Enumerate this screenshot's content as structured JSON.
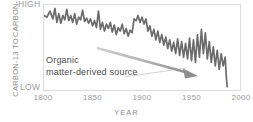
{
  "chart_data": {
    "type": "line",
    "title": "",
    "xlabel": "YEAR",
    "ylabel": "CARBON-13 TO CARBON-12 RATIO",
    "ylabel_line1": "CARBON-13 TO",
    "ylabel_line2": "CARBON-12 RATIO",
    "xlim": [
      1800,
      2000
    ],
    "ylim": [
      0,
      100
    ],
    "ytick_labels": [
      "HIGH",
      "LOW"
    ],
    "ytick_high": "HIGH",
    "ytick_low": "LOW",
    "xtick_labels": [
      "1800",
      "1850",
      "1900",
      "1950",
      "2000"
    ],
    "xticks": [
      1800,
      1850,
      1900,
      1950,
      2000
    ],
    "grid": false,
    "legend": "none",
    "line_color": "#6b6b6b",
    "frame_color": "#dcdcdc",
    "annotations": [
      {
        "text_line1": "Organic",
        "text_line2": "matter-derived source",
        "text": "Organic matter-derived source",
        "arrow_color": "#9a9a9a",
        "arrow_from": [
          1846,
          62
        ],
        "arrow_to": [
          1945,
          28
        ]
      }
    ],
    "x": [
      1800,
      1803,
      1806,
      1809,
      1811,
      1813,
      1815,
      1817,
      1819,
      1821,
      1823,
      1825,
      1827,
      1829,
      1831,
      1833,
      1835,
      1837,
      1839,
      1841,
      1843,
      1845,
      1847,
      1849,
      1851,
      1853,
      1855,
      1857,
      1859,
      1861,
      1863,
      1865,
      1867,
      1869,
      1871,
      1873,
      1875,
      1877,
      1879,
      1881,
      1883,
      1885,
      1887,
      1889,
      1891,
      1893,
      1895,
      1897,
      1899,
      1901,
      1903,
      1905,
      1907,
      1909,
      1911,
      1913,
      1915,
      1917,
      1919,
      1921,
      1923,
      1925,
      1927,
      1929,
      1931,
      1933,
      1935,
      1937,
      1939,
      1941,
      1943,
      1945,
      1947,
      1949,
      1951,
      1953,
      1955,
      1957,
      1959,
      1961,
      1963,
      1965,
      1967,
      1969,
      1971,
      1973,
      1975,
      1977,
      1979,
      1981,
      1983,
      1984,
      1985
    ],
    "values": [
      88,
      86,
      93,
      84,
      96,
      80,
      90,
      79,
      88,
      83,
      95,
      82,
      88,
      80,
      90,
      78,
      86,
      83,
      94,
      81,
      85,
      79,
      84,
      76,
      82,
      74,
      93,
      72,
      80,
      70,
      78,
      73,
      80,
      69,
      77,
      66,
      74,
      70,
      78,
      67,
      73,
      64,
      71,
      68,
      84,
      82,
      88,
      80,
      86,
      78,
      84,
      70,
      76,
      64,
      72,
      60,
      70,
      57,
      66,
      54,
      63,
      50,
      60,
      47,
      57,
      44,
      61,
      42,
      58,
      40,
      56,
      38,
      62,
      36,
      60,
      34,
      66,
      40,
      72,
      44,
      68,
      38,
      58,
      34,
      52,
      30,
      48,
      26,
      44,
      30,
      40,
      20,
      6
    ],
    "series_name": "Carbon-13 to Carbon-12 ratio"
  }
}
